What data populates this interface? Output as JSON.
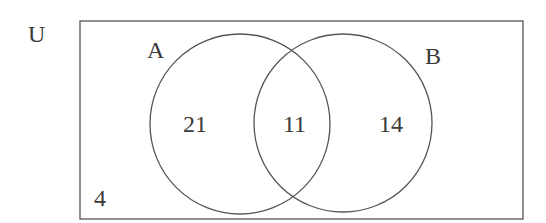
{
  "diagram": {
    "type": "venn",
    "universe_label": "U",
    "sets": [
      {
        "label": "A",
        "only_count": "21"
      },
      {
        "label": "B",
        "only_count": "14"
      }
    ],
    "intersection_count": "11",
    "outside_count": "4",
    "stroke_color": "#555555"
  }
}
